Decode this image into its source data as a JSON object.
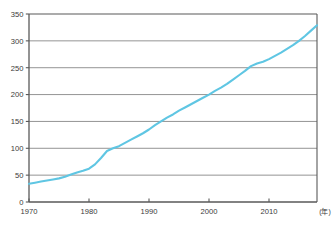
{
  "figure": {
    "top_note": "",
    "source_note": "",
    "unit_label": "(年)"
  },
  "chart_data": {
    "type": "line",
    "title": "",
    "subtitle": "",
    "xlabel": "",
    "ylabel": "",
    "unit_suffix": "(年)",
    "grid": true,
    "grid_axis": "y",
    "legend": false,
    "legend_position": "none",
    "line_color": "#5fc6e3",
    "axis_color": "#595959",
    "grid_color": "#888888",
    "background": "#ffffff",
    "xlim": [
      1970,
      2018
    ],
    "ylim": [
      0,
      350
    ],
    "xticks": [
      1970,
      1980,
      1990,
      2000,
      2010
    ],
    "xtick_labels": [
      "1970",
      "1980",
      "1990",
      "2000",
      "2010"
    ],
    "yticks": [
      0,
      50,
      100,
      150,
      200,
      250,
      300,
      350
    ],
    "ytick_labels": [
      "0",
      "50",
      "100",
      "150",
      "200",
      "250",
      "300",
      "350"
    ],
    "series": [
      {
        "name": "series-1",
        "color": "#5fc6e3",
        "x": [
          1970,
          1971,
          1972,
          1973,
          1974,
          1975,
          1976,
          1977,
          1978,
          1979,
          1980,
          1981,
          1982,
          1983,
          1984,
          1985,
          1986,
          1987,
          1988,
          1989,
          1990,
          1991,
          1992,
          1993,
          1994,
          1995,
          1996,
          1997,
          1998,
          1999,
          2000,
          2001,
          2002,
          2003,
          2004,
          2005,
          2006,
          2007,
          2008,
          2009,
          2010,
          2011,
          2012,
          2013,
          2014,
          2015,
          2016,
          2017,
          2018
        ],
        "values": [
          34,
          36,
          38,
          40,
          42,
          44,
          47,
          51,
          55,
          58,
          62,
          70,
          82,
          95,
          100,
          104,
          110,
          116,
          122,
          128,
          135,
          143,
          150,
          157,
          163,
          170,
          176,
          182,
          188,
          194,
          200,
          207,
          213,
          220,
          228,
          236,
          244,
          253,
          258,
          261,
          266,
          272,
          278,
          285,
          292,
          300,
          309,
          319,
          329
        ]
      }
    ],
    "annotations": []
  }
}
